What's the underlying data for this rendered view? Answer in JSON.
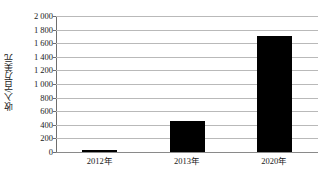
{
  "chart_data": {
    "type": "bar",
    "title": "",
    "subtitle": "",
    "xlabel": "",
    "ylabel": "收入/百万美元",
    "categories": [
      "2012年",
      "2013年",
      "2020年"
    ],
    "values": [
      25,
      450,
      1700
    ],
    "series": [
      {
        "name": "收入",
        "values": [
          25,
          450,
          1700
        ],
        "color": "#000000"
      }
    ],
    "ylim": [
      0,
      2000
    ],
    "ytick_step": 200,
    "ytick_labels": [
      "2 000",
      "1 800",
      "1 600",
      "1 400",
      "1 200",
      "1 000",
      "800",
      "600",
      "400",
      "200",
      "0"
    ],
    "ytick_values": [
      2000,
      1800,
      1600,
      1400,
      1200,
      1000,
      800,
      600,
      400,
      200,
      0
    ],
    "grid": true,
    "grid_axis": "y",
    "legend": false,
    "legend_position": "none",
    "bar_color": "#000000",
    "gridline_color": "#b9b9b9",
    "axis_color": "#6e6e6e",
    "background": "#ffffff",
    "annotations": []
  }
}
